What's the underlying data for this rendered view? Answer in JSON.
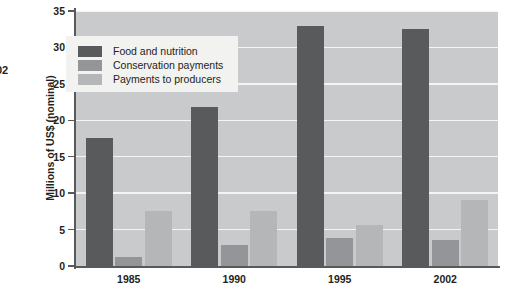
{
  "figure": {
    "edge_fragment": "02",
    "background_color": "#ffffff",
    "plot_background_color": "#c9cacb",
    "gridline_color": "#f4f4f4",
    "axis_color": "#58595b",
    "legend_background_color": "#f2f2f0",
    "text_color": "#231f20"
  },
  "chart_data": {
    "type": "bar",
    "title": "",
    "xlabel": "",
    "ylabel": "Millions of US$ (nominal)",
    "categories": [
      "1985",
      "1990",
      "1995",
      "2002"
    ],
    "yticks": [
      "0",
      "5",
      "10",
      "15",
      "20",
      "25",
      "30",
      "35"
    ],
    "ylim": [
      0,
      35
    ],
    "grid": true,
    "legend_position": "upper left inside",
    "series": [
      {
        "name": "Food and nutrition",
        "color": "#595a5c",
        "values": [
          17.6,
          21.8,
          33.0,
          32.5
        ]
      },
      {
        "name": "Conservation payments",
        "color": "#939598",
        "values": [
          1.2,
          2.9,
          3.9,
          3.6
        ]
      },
      {
        "name": "Payments to producers",
        "color": "#b5b6b8",
        "values": [
          7.6,
          7.6,
          5.6,
          9.0
        ]
      }
    ]
  }
}
